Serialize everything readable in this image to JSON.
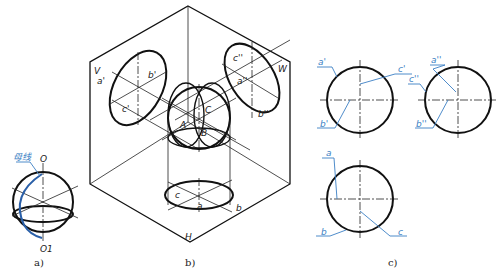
{
  "figure_a": {
    "generatrix_label": "母线",
    "axis_top_label": "O",
    "axis_bottom_label": "O1",
    "caption": "a)"
  },
  "figure_b": {
    "plane_v": "V",
    "plane_w": "W",
    "plane_h": "H",
    "v_labels": {
      "a": "a'",
      "b": "b'",
      "c": "c'"
    },
    "w_labels": {
      "a": "a''",
      "b": "b''",
      "c": "c''"
    },
    "h_labels": {
      "a": "a",
      "b": "b",
      "c": "c"
    },
    "sphere_labels": {
      "A": "A",
      "B": "B",
      "C": "C"
    },
    "caption": "b)"
  },
  "figure_c": {
    "front_view": {
      "a": "a'",
      "b": "b'",
      "c": "c'"
    },
    "side_view": {
      "a": "a''",
      "b": "b''",
      "c": "c''"
    },
    "top_view": {
      "a": "a",
      "b": "b",
      "c": "c"
    },
    "caption": "c)"
  },
  "colors": {
    "line": "#111111",
    "annotation": "#3b7fc4"
  }
}
